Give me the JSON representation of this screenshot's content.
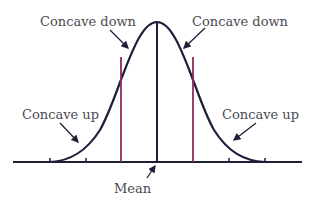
{
  "diagram": {
    "type": "normal-distribution-concavity",
    "colors": {
      "curve": "#1e1e3a",
      "axis": "#1e1e3a",
      "inflection_lines": "#8b2a5c",
      "text": "#4a4a52"
    },
    "labels": {
      "concave_down_left": "Concave down",
      "concave_down_right": "Concave down",
      "concave_up_left": "Concave up",
      "concave_up_right": "Concave up",
      "mean": "Mean"
    }
  }
}
